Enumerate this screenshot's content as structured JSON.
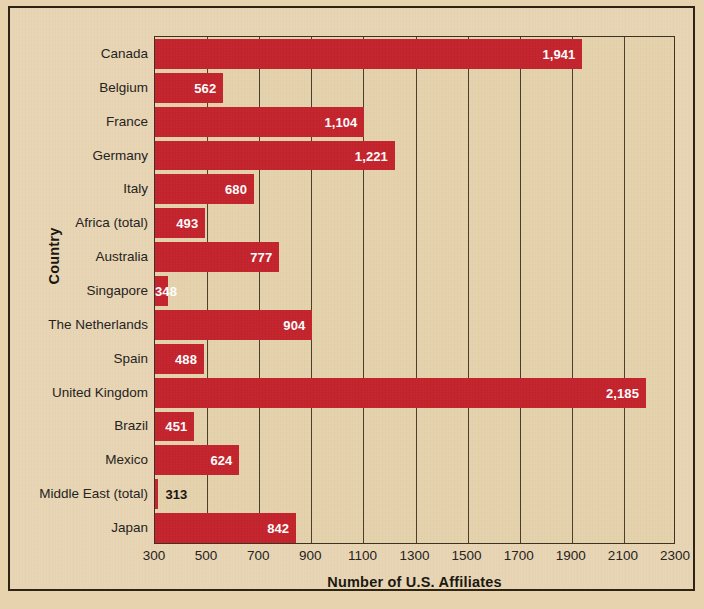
{
  "chart_data": {
    "type": "bar",
    "orientation": "horizontal",
    "title": "",
    "xlabel": "Number of U.S. Affiliates",
    "ylabel": "Country",
    "xlim": [
      300,
      2300
    ],
    "xticks": [
      300,
      500,
      700,
      900,
      1100,
      1300,
      1500,
      1700,
      1900,
      2100,
      2300
    ],
    "xtick_labels": [
      "300",
      "500",
      "700",
      "900",
      "1100",
      "1300",
      "1500",
      "1700",
      "1900",
      "2100",
      "2300"
    ],
    "grid": true,
    "grid_axis": "x",
    "legend": false,
    "bar_color": "#c4222c",
    "background_color": "#e7d3ae",
    "categories": [
      "Canada",
      "Belgium",
      "France",
      "Germany",
      "Italy",
      "Africa (total)",
      "Australia",
      "Singapore",
      "The Netherlands",
      "Spain",
      "United Kingdom",
      "Brazil",
      "Mexico",
      "Middle East (total)",
      "Japan"
    ],
    "values": [
      1941,
      562,
      1104,
      1221,
      680,
      493,
      777,
      348,
      904,
      488,
      2185,
      451,
      624,
      313,
      842
    ],
    "value_labels": [
      "1,941",
      "562",
      "1,104",
      "1,221",
      "680",
      "493",
      "777",
      "348",
      "904",
      "488",
      "2,185",
      "451",
      "624",
      "313",
      "842"
    ],
    "label_placement": [
      "inside",
      "inside",
      "inside",
      "inside",
      "inside",
      "inside",
      "inside",
      "inside",
      "inside",
      "inside",
      "inside",
      "inside",
      "inside",
      "outside",
      "inside"
    ]
  }
}
